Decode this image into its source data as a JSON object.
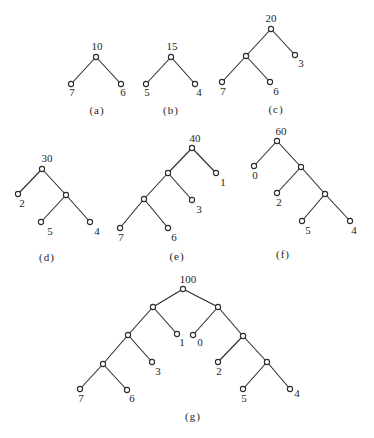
{
  "figure": {
    "background": "#ffffff",
    "ink_color": "#2b2b2b",
    "node_radius": 2.6,
    "trees": [
      {
        "id": "a",
        "caption": "(a)",
        "caption_pos": [
          97,
          114
        ],
        "nodes": [
          {
            "id": "r",
            "x": 96,
            "y": 57,
            "label": "10",
            "lx": 97,
            "ly": 50,
            "anchor": "middle"
          },
          {
            "id": "l",
            "x": 71,
            "y": 84,
            "label": "7",
            "lx": 72,
            "ly": 96,
            "anchor": "middle"
          },
          {
            "id": "rr",
            "x": 121,
            "y": 84,
            "label": "6",
            "lx": 123,
            "ly": 96,
            "anchor": "middle"
          }
        ],
        "edges": [
          [
            "r",
            "l"
          ],
          [
            "r",
            "rr"
          ]
        ]
      },
      {
        "id": "b",
        "caption": "(b)",
        "caption_pos": [
          171,
          114
        ],
        "nodes": [
          {
            "id": "r",
            "x": 171,
            "y": 57,
            "label": "15",
            "lx": 172,
            "ly": 50,
            "anchor": "middle"
          },
          {
            "id": "l",
            "x": 146,
            "y": 84,
            "label": "5",
            "lx": 147,
            "ly": 96,
            "anchor": "middle"
          },
          {
            "id": "rr",
            "x": 195,
            "y": 84,
            "label": "4",
            "lx": 199,
            "ly": 96,
            "anchor": "middle"
          }
        ],
        "edges": [
          [
            "r",
            "l"
          ],
          [
            "r",
            "rr"
          ]
        ]
      },
      {
        "id": "c",
        "caption": "(c)",
        "caption_pos": [
          276,
          113
        ],
        "nodes": [
          {
            "id": "r",
            "x": 271,
            "y": 29,
            "label": "20",
            "lx": 271,
            "ly": 22,
            "anchor": "middle"
          },
          {
            "id": "i1",
            "x": 246,
            "y": 56,
            "label": "",
            "lx": 0,
            "ly": 0,
            "anchor": "middle"
          },
          {
            "id": "l3",
            "x": 295,
            "y": 55,
            "label": "3",
            "lx": 301,
            "ly": 67,
            "anchor": "middle"
          },
          {
            "id": "l7",
            "x": 222,
            "y": 82,
            "label": "7",
            "lx": 223,
            "ly": 95,
            "anchor": "middle"
          },
          {
            "id": "l6",
            "x": 270,
            "y": 82,
            "label": "6",
            "lx": 276,
            "ly": 95,
            "anchor": "middle"
          }
        ],
        "edges": [
          [
            "r",
            "i1"
          ],
          [
            "r",
            "l3"
          ],
          [
            "i1",
            "l7"
          ],
          [
            "i1",
            "l6"
          ]
        ]
      },
      {
        "id": "d",
        "caption": "(d)",
        "caption_pos": [
          47,
          261
        ],
        "nodes": [
          {
            "id": "r",
            "x": 42,
            "y": 169,
            "label": "30",
            "lx": 47,
            "ly": 162,
            "anchor": "middle"
          },
          {
            "id": "l2",
            "x": 18,
            "y": 194,
            "label": "2",
            "lx": 22,
            "ly": 207,
            "anchor": "middle"
          },
          {
            "id": "i1",
            "x": 66,
            "y": 195,
            "label": "",
            "lx": 0,
            "ly": 0,
            "anchor": "middle"
          },
          {
            "id": "l5",
            "x": 41,
            "y": 222,
            "label": "5",
            "lx": 50,
            "ly": 235,
            "anchor": "middle"
          },
          {
            "id": "l4",
            "x": 90,
            "y": 222,
            "label": "4",
            "lx": 97,
            "ly": 235,
            "anchor": "middle"
          }
        ],
        "edges": [
          [
            "r",
            "l2"
          ],
          [
            "r",
            "i1"
          ],
          [
            "i1",
            "l5"
          ],
          [
            "i1",
            "l4"
          ]
        ]
      },
      {
        "id": "e",
        "caption": "(e)",
        "caption_pos": [
          177,
          260
        ],
        "nodes": [
          {
            "id": "r",
            "x": 192,
            "y": 148,
            "label": "40",
            "lx": 195,
            "ly": 142,
            "anchor": "middle"
          },
          {
            "id": "i1",
            "x": 168,
            "y": 173,
            "label": "",
            "lx": 0,
            "ly": 0,
            "anchor": "middle"
          },
          {
            "id": "l1",
            "x": 216,
            "y": 173,
            "label": "1",
            "lx": 223,
            "ly": 186,
            "anchor": "middle"
          },
          {
            "id": "i2",
            "x": 144,
            "y": 199,
            "label": "",
            "lx": 0,
            "ly": 0,
            "anchor": "middle"
          },
          {
            "id": "l3",
            "x": 192,
            "y": 200,
            "label": "3",
            "lx": 199,
            "ly": 213,
            "anchor": "middle"
          },
          {
            "id": "l7",
            "x": 120,
            "y": 228,
            "label": "7",
            "lx": 121,
            "ly": 241,
            "anchor": "middle"
          },
          {
            "id": "l6",
            "x": 168,
            "y": 228,
            "label": "6",
            "lx": 174,
            "ly": 241,
            "anchor": "middle"
          }
        ],
        "edges": [
          [
            "r",
            "i1"
          ],
          [
            "r",
            "l1"
          ],
          [
            "i1",
            "i2"
          ],
          [
            "i1",
            "l3"
          ],
          [
            "i2",
            "l7"
          ],
          [
            "i2",
            "l6"
          ]
        ]
      },
      {
        "id": "f",
        "caption": "(f)",
        "caption_pos": [
          283,
          258
        ],
        "nodes": [
          {
            "id": "r",
            "x": 277,
            "y": 141,
            "label": "60",
            "lx": 281,
            "ly": 135,
            "anchor": "middle"
          },
          {
            "id": "l0",
            "x": 254,
            "y": 166,
            "label": "0",
            "lx": 255,
            "ly": 179,
            "anchor": "middle"
          },
          {
            "id": "i1",
            "x": 301,
            "y": 167,
            "label": "",
            "lx": 0,
            "ly": 0,
            "anchor": "middle"
          },
          {
            "id": "l2",
            "x": 277,
            "y": 193,
            "label": "2",
            "lx": 279,
            "ly": 206,
            "anchor": "middle"
          },
          {
            "id": "i2",
            "x": 325,
            "y": 194,
            "label": "",
            "lx": 0,
            "ly": 0,
            "anchor": "middle"
          },
          {
            "id": "l5",
            "x": 302,
            "y": 221,
            "label": "5",
            "lx": 308,
            "ly": 234,
            "anchor": "middle"
          },
          {
            "id": "l4",
            "x": 350,
            "y": 221,
            "label": "4",
            "lx": 354,
            "ly": 234,
            "anchor": "middle"
          }
        ],
        "edges": [
          [
            "r",
            "l0"
          ],
          [
            "r",
            "i1"
          ],
          [
            "i1",
            "l2"
          ],
          [
            "i1",
            "i2"
          ],
          [
            "i2",
            "l5"
          ],
          [
            "i2",
            "l4"
          ]
        ]
      },
      {
        "id": "g",
        "caption": "(g)",
        "caption_pos": [
          193,
          420
        ],
        "nodes": [
          {
            "id": "r",
            "x": 183,
            "y": 289,
            "label": "100",
            "lx": 188,
            "ly": 283,
            "anchor": "middle"
          },
          {
            "id": "a1",
            "x": 153,
            "y": 307,
            "label": "",
            "lx": 0,
            "ly": 0,
            "anchor": "middle"
          },
          {
            "id": "b1",
            "x": 218,
            "y": 307,
            "label": "",
            "lx": 0,
            "ly": 0,
            "anchor": "middle"
          },
          {
            "id": "a2",
            "x": 128,
            "y": 335,
            "label": "",
            "lx": 0,
            "ly": 0,
            "anchor": "middle"
          },
          {
            "id": "l1",
            "x": 177,
            "y": 334,
            "label": "1",
            "lx": 182,
            "ly": 346,
            "anchor": "middle"
          },
          {
            "id": "l0",
            "x": 193,
            "y": 335,
            "label": "0",
            "lx": 200,
            "ly": 346,
            "anchor": "middle"
          },
          {
            "id": "b2",
            "x": 243,
            "y": 336,
            "label": "",
            "lx": 0,
            "ly": 0,
            "anchor": "middle"
          },
          {
            "id": "a3",
            "x": 103,
            "y": 364,
            "label": "",
            "lx": 0,
            "ly": 0,
            "anchor": "middle"
          },
          {
            "id": "l3",
            "x": 152,
            "y": 362,
            "label": "3",
            "lx": 158,
            "ly": 375,
            "anchor": "middle"
          },
          {
            "id": "l2",
            "x": 218,
            "y": 362,
            "label": "2",
            "lx": 219,
            "ly": 375,
            "anchor": "middle"
          },
          {
            "id": "b3",
            "x": 267,
            "y": 362,
            "label": "",
            "lx": 0,
            "ly": 0,
            "anchor": "middle"
          },
          {
            "id": "l7",
            "x": 80,
            "y": 389,
            "label": "7",
            "lx": 81,
            "ly": 402,
            "anchor": "middle"
          },
          {
            "id": "l6",
            "x": 127,
            "y": 390,
            "label": "6",
            "lx": 132,
            "ly": 402,
            "anchor": "middle"
          },
          {
            "id": "l5",
            "x": 243,
            "y": 389,
            "label": "5",
            "lx": 244,
            "ly": 402,
            "anchor": "middle"
          },
          {
            "id": "l4",
            "x": 290,
            "y": 389,
            "label": "4",
            "lx": 297,
            "ly": 397,
            "anchor": "middle"
          }
        ],
        "edges": [
          [
            "r",
            "a1"
          ],
          [
            "r",
            "b1"
          ],
          [
            "a1",
            "a2"
          ],
          [
            "a1",
            "l1"
          ],
          [
            "b1",
            "l0"
          ],
          [
            "b1",
            "b2"
          ],
          [
            "a2",
            "a3"
          ],
          [
            "a2",
            "l3"
          ],
          [
            "b2",
            "l2"
          ],
          [
            "b2",
            "b3"
          ],
          [
            "a3",
            "l7"
          ],
          [
            "a3",
            "l6"
          ],
          [
            "b3",
            "l5"
          ],
          [
            "b3",
            "l4"
          ]
        ]
      }
    ]
  }
}
